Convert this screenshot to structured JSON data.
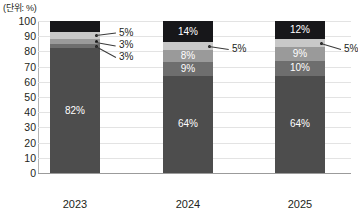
{
  "unit_caption": "(단위: %)",
  "chart_data": {
    "type": "bar",
    "title": "",
    "subtitle": "",
    "xlabel": "",
    "ylabel": "",
    "unit_note": "(단위: %)",
    "stacked": true,
    "stack_total": 100,
    "grid": true,
    "legend": "none",
    "ylim": [
      0,
      100
    ],
    "yticks": [
      100,
      90,
      80,
      70,
      60,
      50,
      40,
      30,
      20,
      10,
      0
    ],
    "categories": [
      "2023",
      "2024",
      "2025"
    ],
    "series": [
      {
        "name": "base",
        "color": "#4d4d4d",
        "values": [
          82,
          64,
          64
        ]
      },
      {
        "name": "tier2",
        "color": "#6e6e6e",
        "values": [
          3,
          9,
          10
        ]
      },
      {
        "name": "tier3",
        "color": "#9a9a9a",
        "values": [
          3,
          8,
          9
        ]
      },
      {
        "name": "tier4",
        "color": "#c8c8c8",
        "values": [
          5,
          5,
          5
        ]
      },
      {
        "name": "top",
        "color": "#17171a",
        "values": [
          7,
          14,
          12
        ]
      }
    ],
    "data_labels": {
      "2023": {
        "base": "82%",
        "tier2": "3%",
        "tier3": "3%",
        "tier4": "5%",
        "top": "7%"
      },
      "2024": {
        "base": "64%",
        "tier2": "9%",
        "tier3": "8%",
        "tier4": "5%",
        "top": "14%"
      },
      "2025": {
        "base": "64%",
        "tier2": "10%",
        "tier3": "9%",
        "tier4": "5%",
        "top": "12%"
      }
    },
    "callouts": [
      {
        "category": "2023",
        "series": "tier4",
        "label": "5%"
      },
      {
        "category": "2023",
        "series": "tier3",
        "label": "3%"
      },
      {
        "category": "2023",
        "series": "tier2",
        "label": "3%"
      },
      {
        "category": "2024",
        "series": "tier4",
        "label": "5%"
      },
      {
        "category": "2025",
        "series": "tier4",
        "label": "5%"
      }
    ]
  },
  "axis": {
    "y_tick_labels": [
      "100",
      "90",
      "80",
      "70",
      "60",
      "50",
      "40",
      "30",
      "20",
      "10",
      "0"
    ],
    "x_tick_labels": [
      "2023",
      "2024",
      "2025"
    ]
  },
  "labels": {
    "y2023_base": "82%",
    "y2023_tier2": "3%",
    "y2023_tier3": "3%",
    "y2023_tier4": "5%",
    "y2023_top": "7%",
    "y2024_base": "64%",
    "y2024_tier2": "9%",
    "y2024_tier3": "8%",
    "y2024_tier4": "5%",
    "y2024_top": "14%",
    "y2025_base": "64%",
    "y2025_tier2": "10%",
    "y2025_tier3": "9%",
    "y2025_tier4": "5%",
    "y2025_top": "12%"
  },
  "callout_labels": {
    "c2023_tier4": "5%",
    "c2023_tier3": "3%",
    "c2023_tier2": "3%",
    "c2024_tier4": "5%",
    "c2025_tier4": "5%"
  }
}
